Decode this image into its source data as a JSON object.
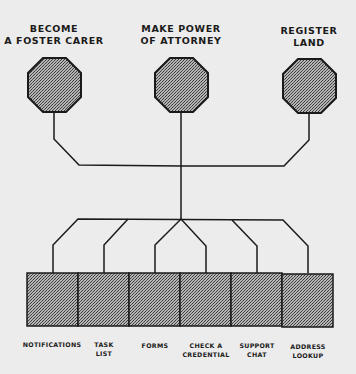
{
  "colors": {
    "background": "#ececec",
    "stroke": "#1a1a1a",
    "fill_base": "#a8a8a8",
    "fill_dot": "#3a3a3a"
  },
  "services": [
    {
      "label": "BECOME\nA FOSTER CARER",
      "shape": "octagon",
      "cx": 54,
      "cy": 85
    },
    {
      "label": "MAKE POWER\nOF ATTORNEY",
      "shape": "octagon",
      "cx": 181,
      "cy": 85
    },
    {
      "label": "REGISTER\nLAND",
      "shape": "octagon",
      "cx": 309,
      "cy": 85
    }
  ],
  "components": [
    {
      "label": "NOTIFICATIONS"
    },
    {
      "label": "TASK\nLIST"
    },
    {
      "label": "FORMS"
    },
    {
      "label": "CHECK A\nCREDENTIAL"
    },
    {
      "label": "SUPPORT\nCHAT"
    },
    {
      "label": "ADDRESS\nLOOKUP"
    }
  ]
}
